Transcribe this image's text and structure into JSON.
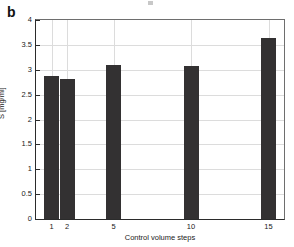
{
  "figure": {
    "panel_label": "b",
    "background_color": "#ffffff",
    "bar_color": "#333132",
    "axis_color": "#2b2b2b",
    "grid_color": "#dcdcdc"
  },
  "chart_data": {
    "type": "bar",
    "title": "",
    "xlabel": "Control volume steps",
    "ylabel": "S [mg/ml]",
    "categories": [
      "1",
      "2",
      "5",
      "10",
      "15"
    ],
    "values": [
      2.88,
      2.82,
      3.1,
      3.07,
      3.63
    ],
    "ylim": [
      0,
      4
    ],
    "yticks": [
      0,
      0.5,
      1,
      1.5,
      2,
      2.5,
      3,
      3.5,
      4
    ],
    "ytick_labels": [
      "0",
      "0.5",
      "1",
      "1.5",
      "2",
      "2.5",
      "3",
      "3.5",
      "4"
    ],
    "xtick_labels": [
      "1",
      "2",
      "5",
      "10",
      "15"
    ],
    "x_positions": [
      1,
      2,
      5,
      10,
      15
    ],
    "xlim": [
      0,
      16
    ],
    "grid": "horizontal-and-vertical",
    "legend": "none"
  }
}
